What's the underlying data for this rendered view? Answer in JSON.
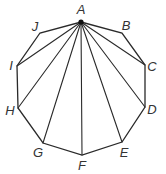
{
  "diagram": {
    "type": "decagon-diagonals",
    "hub": "A",
    "vertices": [
      {
        "id": "A",
        "x": 81,
        "y": 22,
        "lx": 81,
        "ly": 14,
        "label": "A"
      },
      {
        "id": "B",
        "x": 122,
        "y": 33,
        "lx": 126,
        "ly": 30,
        "label": "B"
      },
      {
        "id": "C",
        "x": 145,
        "y": 65,
        "lx": 152,
        "ly": 71,
        "label": "C"
      },
      {
        "id": "D",
        "x": 145,
        "y": 107,
        "lx": 152,
        "ly": 114,
        "label": "D"
      },
      {
        "id": "E",
        "x": 122,
        "y": 142,
        "lx": 124,
        "ly": 157,
        "label": "E"
      },
      {
        "id": "F",
        "x": 82,
        "y": 155,
        "lx": 82,
        "ly": 170,
        "label": "F"
      },
      {
        "id": "G",
        "x": 43,
        "y": 143,
        "lx": 38,
        "ly": 157,
        "label": "G"
      },
      {
        "id": "H",
        "x": 18,
        "y": 108,
        "lx": 10,
        "ly": 115,
        "label": "H"
      },
      {
        "id": "I",
        "x": 17,
        "y": 66,
        "lx": 11,
        "ly": 70,
        "label": "I"
      },
      {
        "id": "J",
        "x": 40,
        "y": 33,
        "lx": 35,
        "ly": 31,
        "label": "J"
      }
    ],
    "diagonals_from_hub": [
      "C",
      "D",
      "E",
      "F",
      "G",
      "H",
      "I"
    ]
  }
}
